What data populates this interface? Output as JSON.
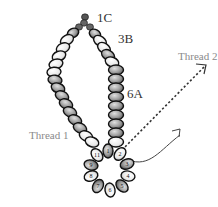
{
  "diagram": {
    "labels": {
      "top_beads": "1C",
      "right_upper": "3B",
      "right_strand": "6A",
      "thread_1": "Thread 1",
      "thread_2": "Thread 2"
    },
    "ring_beads": [
      "1",
      "2",
      "3",
      "4",
      "5",
      "6",
      "7",
      "8",
      "9",
      "10",
      "11"
    ],
    "colors": {
      "bead_outline": "#111111",
      "bead_light": "#f2f2f2",
      "bead_gray": "#9a9a9a",
      "small_bead": "#555555",
      "thread": "#333333",
      "label_gray": "#8a8a8a",
      "label_dark": "#333333"
    }
  }
}
